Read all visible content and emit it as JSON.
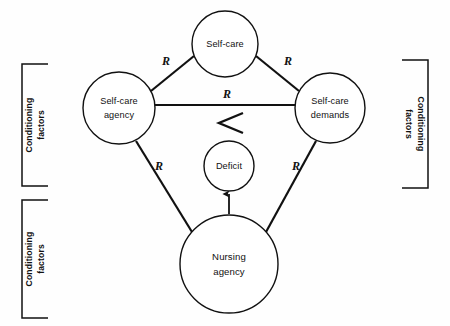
{
  "diagram": {
    "type": "concept-diagram",
    "colors": {
      "stroke": "#111111",
      "background": "#fefefe",
      "node_fill": "#ffffff"
    },
    "nodes": [
      {
        "id": "self-care",
        "label": "Self-care",
        "line1": "Self-care",
        "line2": "",
        "cx": 225,
        "cy": 44,
        "r": 33
      },
      {
        "id": "self-care-agency",
        "label": "Self-care agency",
        "line1": "Self-care",
        "line2": "agency",
        "cx": 119,
        "cy": 108,
        "r": 36
      },
      {
        "id": "self-care-demands",
        "label": "Self-care demands",
        "line1": "Self-care",
        "line2": "demands",
        "cx": 330,
        "cy": 108,
        "r": 35
      },
      {
        "id": "deficit",
        "label": "Deficit",
        "line1": "Deficit",
        "line2": "",
        "cx": 229,
        "cy": 166,
        "r": 25
      },
      {
        "id": "nursing-agency",
        "label": "Nursing agency",
        "line1": "Nursing",
        "line2": "agency",
        "cx": 229,
        "cy": 264,
        "r": 49
      }
    ],
    "relation_symbol": "R",
    "inequality_symbol": "<",
    "edges": [
      {
        "id": "agency-to-selfcare",
        "from": "self-care-agency",
        "to": "self-care",
        "label": "R",
        "label_x": 166,
        "label_y": 62
      },
      {
        "id": "selfcare-to-demands",
        "from": "self-care",
        "to": "self-care-demands",
        "label": "R",
        "label_x": 288,
        "label_y": 62
      },
      {
        "id": "agency-to-demands",
        "from": "self-care-agency",
        "to": "self-care-demands",
        "label": "R",
        "label_x": 227,
        "label_y": 94
      },
      {
        "id": "nursing-to-agency",
        "from": "nursing-agency",
        "to": "self-care-agency",
        "label": "R",
        "label_x": 159,
        "label_y": 167
      },
      {
        "id": "nursing-to-demands",
        "from": "nursing-agency",
        "to": "self-care-demands",
        "label": "R",
        "label_x": 296,
        "label_y": 167
      },
      {
        "id": "nursing-to-deficit",
        "from": "nursing-agency",
        "to": "deficit",
        "label": "",
        "label_x": 0,
        "label_y": 0
      }
    ],
    "brackets": [
      {
        "id": "left-upper",
        "label": "Conditioning factors",
        "line1": "Conditioning",
        "line2": "factors",
        "side": "left",
        "x": 22,
        "y": 64,
        "w": 26,
        "h": 122
      },
      {
        "id": "left-lower",
        "label": "Conditioning factors",
        "line1": "Conditioning",
        "line2": "factors",
        "side": "left",
        "x": 22,
        "y": 200,
        "w": 26,
        "h": 118
      },
      {
        "id": "right-upper",
        "label": "Conditioning factors",
        "line1": "Conditioning",
        "line2": "factors",
        "side": "right",
        "x": 402,
        "y": 60,
        "w": 26,
        "h": 128
      }
    ]
  }
}
